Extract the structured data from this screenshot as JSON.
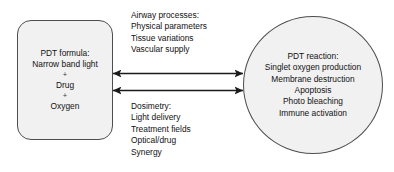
{
  "diagram": {
    "background_color": "#ffffff",
    "shape_fill_color": "#f1f1f1",
    "shape_stroke_color": "#4d4d4d",
    "text_color": "#111111"
  },
  "left_box": {
    "shape": "rounded-rectangle",
    "heading": "PDT formula:",
    "line1": "Narrow band light",
    "plus1": "+",
    "line2": "Drug",
    "plus2": "+",
    "line3": "Oxygen"
  },
  "right_circle": {
    "shape": "circle",
    "heading": "PDT reaction:",
    "line1": "Singlet oxygen production",
    "line2": "Membrane destruction",
    "line3": "Apoptosis",
    "line4": "Photo bleaching",
    "line5": "Immune activation"
  },
  "label_airway": {
    "heading": "Airway processes:",
    "line1": "Physical parameters",
    "line2": "Tissue variations",
    "line3": "Vascular supply"
  },
  "label_dosimetry": {
    "heading": "Dosimetry:",
    "line1": "Light delivery",
    "line2": "Treatment fields",
    "line3": "Optical/drug",
    "line4": "Synergy"
  },
  "arrows": {
    "top_arrow_name": "double-headed-arrow-top",
    "bottom_arrow_name": "double-headed-arrow-bottom",
    "stroke_color": "#1a1a1a"
  }
}
